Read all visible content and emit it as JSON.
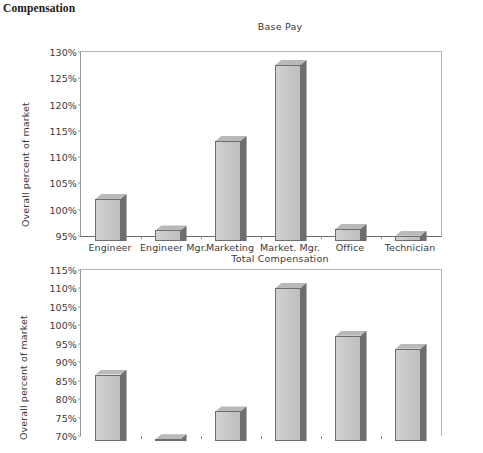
{
  "page": {
    "heading": "Compensation"
  },
  "chart_data": [
    {
      "type": "bar",
      "id": "base-pay",
      "title": "Base Pay",
      "xlabel": "",
      "ylabel": "Overall percent of market",
      "categories": [
        "Engineer",
        "Engineer Mgr.",
        "Marketing",
        "Market. Mgr.",
        "Office",
        "Technician"
      ],
      "values": [
        103,
        97,
        114,
        128.5,
        97.3,
        96
      ],
      "ylim": [
        95,
        130
      ],
      "yticks": [
        "95%",
        "100%",
        "105%",
        "110%",
        "115%",
        "120%",
        "125%",
        "130%"
      ],
      "ytick_values": [
        95,
        100,
        105,
        110,
        115,
        120,
        125,
        130
      ],
      "grid": false,
      "legend": "none"
    },
    {
      "type": "bar",
      "id": "total-compensation",
      "title": "Total Compensation",
      "xlabel": "",
      "ylabel": "Overall percent of market",
      "categories": [
        "Engineer",
        "Engineer Mgr.",
        "Marketing",
        "Market. Mgr.",
        "Office",
        "Technician"
      ],
      "values": [
        88,
        70.5,
        78,
        111.5,
        98.5,
        95
      ],
      "ylim": [
        70,
        115
      ],
      "yticks": [
        "70%",
        "75%",
        "80%",
        "85%",
        "90%",
        "95%",
        "100%",
        "105%",
        "110%",
        "115%"
      ],
      "ytick_values": [
        70,
        75,
        80,
        85,
        90,
        95,
        100,
        105,
        110,
        115
      ],
      "grid": false,
      "legend": "none"
    }
  ],
  "colors": {
    "bar_face": "#c8c8c8",
    "bar_side": "#6e6e6e",
    "bar_top": "#b9b9b9",
    "axis": "#6a6a6a",
    "text": "#3a3a3a",
    "background": "#ffffff"
  }
}
